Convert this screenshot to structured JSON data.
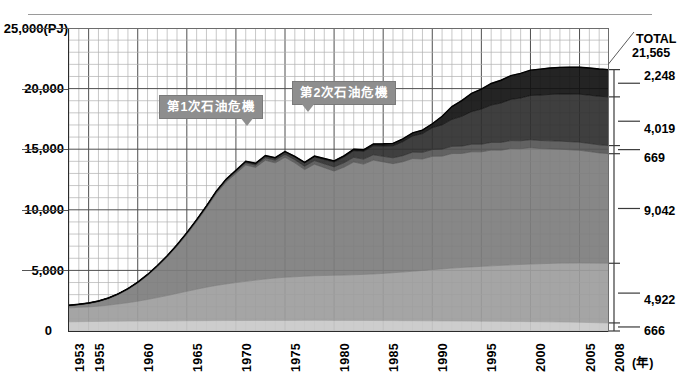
{
  "chart_data": {
    "type": "area",
    "title": "",
    "subtitle": "",
    "xlabel": "(年)",
    "ylabel": "(PJ)",
    "unit_note": "(PJ)",
    "xlim": [
      1953,
      2008
    ],
    "ylim": [
      0,
      25000
    ],
    "grid": true,
    "legend_position": "right-bracket",
    "y_ticks": [
      "0",
      "5,000",
      "10,000",
      "15,000",
      "20,000",
      "25,000"
    ],
    "y_tick_values": [
      0,
      5000,
      10000,
      15000,
      20000,
      25000
    ],
    "x_ticks": [
      "1953",
      "1955",
      "1960",
      "1965",
      "1970",
      "1975",
      "1980",
      "1985",
      "1990",
      "1995",
      "2000",
      "2005",
      "2008"
    ],
    "x_tick_values": [
      1953,
      1955,
      1960,
      1965,
      1970,
      1975,
      1980,
      1985,
      1990,
      1995,
      2000,
      2005,
      2008
    ],
    "total_label": "TOTAL",
    "total_value": "21,565",
    "stack_order": "bottom-to-top",
    "series": [
      {
        "name": "layer-1-bottom",
        "end_label": "666",
        "end_value": 666,
        "color": "#c9c9c9",
        "values": [
          760,
          770,
          780,
          790,
          800,
          810,
          815,
          820,
          825,
          830,
          835,
          840,
          845,
          850,
          855,
          860,
          862,
          864,
          866,
          868,
          870,
          872,
          874,
          876,
          878,
          880,
          878,
          876,
          874,
          872,
          870,
          866,
          862,
          858,
          854,
          850,
          845,
          840,
          835,
          830,
          825,
          820,
          812,
          804,
          796,
          788,
          780,
          772,
          764,
          756,
          748,
          735,
          720,
          700,
          680,
          666
        ]
      },
      {
        "name": "layer-2",
        "end_label": "4,922",
        "end_value": 4922,
        "color": "#9d9d9d",
        "values": [
          1150,
          1180,
          1210,
          1260,
          1330,
          1420,
          1520,
          1640,
          1780,
          1930,
          2090,
          2260,
          2430,
          2600,
          2760,
          2900,
          3020,
          3130,
          3230,
          3330,
          3420,
          3500,
          3560,
          3600,
          3640,
          3680,
          3700,
          3720,
          3740,
          3770,
          3800,
          3840,
          3890,
          3950,
          4010,
          4080,
          4150,
          4220,
          4290,
          4360,
          4420,
          4470,
          4520,
          4570,
          4620,
          4670,
          4710,
          4750,
          4790,
          4820,
          4850,
          4870,
          4890,
          4905,
          4915,
          4922
        ]
      },
      {
        "name": "layer-3-main",
        "end_label": "9,042",
        "end_value": 9042,
        "color": "#7d7d7d",
        "values": [
          160,
          200,
          260,
          360,
          520,
          760,
          1080,
          1480,
          1960,
          2520,
          3160,
          3880,
          4680,
          5560,
          6520,
          7560,
          8400,
          9000,
          9600,
          9300,
          9800,
          9500,
          9900,
          9400,
          8800,
          9200,
          8900,
          8600,
          8900,
          9300,
          9100,
          9400,
          9200,
          9000,
          9100,
          9300,
          9200,
          9350,
          9300,
          9450,
          9400,
          9500,
          9450,
          9550,
          9500,
          9600,
          9550,
          9600,
          9500,
          9450,
          9400,
          9350,
          9300,
          9200,
          9100,
          9042
        ]
      },
      {
        "name": "layer-4",
        "end_label": "669",
        "end_value": 669,
        "color": "#555555",
        "values": [
          40,
          42,
          45,
          48,
          52,
          56,
          60,
          65,
          70,
          76,
          82,
          90,
          98,
          108,
          118,
          130,
          142,
          156,
          170,
          186,
          202,
          220,
          238,
          258,
          278,
          300,
          320,
          342,
          364,
          388,
          412,
          436,
          460,
          482,
          504,
          524,
          544,
          562,
          578,
          594,
          608,
          620,
          630,
          638,
          645,
          651,
          656,
          660,
          663,
          665,
          666,
          667,
          668,
          668,
          669,
          669
        ]
      },
      {
        "name": "layer-5",
        "end_label": "4,019",
        "end_value": 4019,
        "color": "#2f2f2f",
        "values": [
          10,
          11,
          12,
          13,
          15,
          17,
          19,
          22,
          25,
          29,
          33,
          38,
          44,
          51,
          59,
          68,
          79,
          92,
          107,
          124,
          144,
          167,
          194,
          225,
          261,
          303,
          352,
          408,
          474,
          550,
          638,
          740,
          858,
          995,
          1154,
          1338,
          1552,
          1800,
          2010,
          2230,
          2460,
          2690,
          2900,
          3080,
          3250,
          3400,
          3530,
          3650,
          3750,
          3830,
          3890,
          3930,
          3960,
          3985,
          4005,
          4019
        ]
      },
      {
        "name": "layer-6-top",
        "end_label": "2,248",
        "end_value": 2248,
        "color": "#111111",
        "values": [
          5,
          5,
          6,
          6,
          7,
          8,
          8,
          9,
          10,
          11,
          12,
          14,
          15,
          17,
          19,
          22,
          24,
          27,
          31,
          35,
          39,
          44,
          50,
          56,
          64,
          72,
          82,
          92,
          105,
          119,
          135,
          153,
          174,
          197,
          224,
          254,
          288,
          327,
          700,
          1050,
          1300,
          1500,
          1650,
          1780,
          1880,
          1960,
          2030,
          2090,
          2140,
          2180,
          2200,
          2215,
          2228,
          2238,
          2244,
          2248
        ]
      }
    ]
  },
  "annotations": [
    {
      "name": "first-oil-crisis",
      "text": "第1次石油危機",
      "year": 1973
    },
    {
      "name": "second-oil-crisis",
      "text": "第2次石油危機",
      "year": 1979
    }
  ],
  "right_panel": {
    "total_caption": "TOTAL",
    "total_value": "21,565",
    "segment_labels": [
      "2,248",
      "4,019",
      "669",
      "9,042",
      "4,922",
      "666"
    ]
  }
}
